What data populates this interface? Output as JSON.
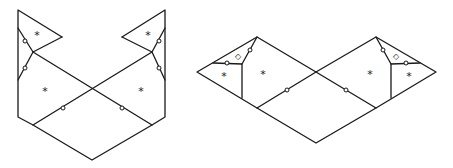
{
  "figures": [
    {
      "name": "left-figure",
      "labels": {
        "star": "*",
        "diamond": "◇"
      },
      "regions": [
        {
          "symbol": "*",
          "x": 37,
          "y": 35
        },
        {
          "symbol": "*",
          "x": 148,
          "y": 35
        },
        {
          "symbol": "*",
          "x": 45,
          "y": 90
        },
        {
          "symbol": "*",
          "x": 141,
          "y": 90
        }
      ]
    },
    {
      "name": "right-figure",
      "regions": [
        {
          "symbol": "*",
          "x": 224,
          "y": 75
        },
        {
          "symbol": "*",
          "x": 263,
          "y": 73
        },
        {
          "symbol": "*",
          "x": 370,
          "y": 73
        },
        {
          "symbol": "*",
          "x": 409,
          "y": 75
        },
        {
          "symbol": "◇",
          "x": 238,
          "y": 56
        },
        {
          "symbol": "◇",
          "x": 396,
          "y": 56
        }
      ]
    }
  ],
  "marks": {
    "l1": "*",
    "l2": "*",
    "l3": "*",
    "l4": "*",
    "r1": "*",
    "r2": "*",
    "r3": "*",
    "r4": "*",
    "d1": "◇",
    "d2": "◇"
  }
}
